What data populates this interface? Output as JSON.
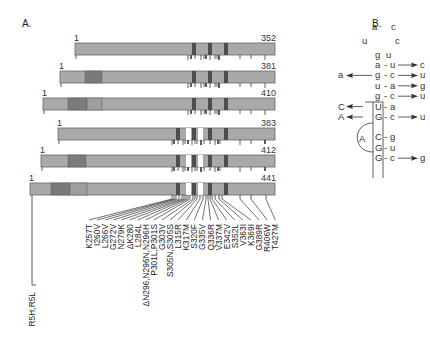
{
  "panels": {
    "a_label": "A.",
    "b_label": "B."
  },
  "colors": {
    "bar_fill": "#a9a9a9",
    "bar_stroke": "#666666",
    "n_domain_dark": "#7a7a7a",
    "n_domain_light": "#9e9e9e",
    "repeat_dark": "#4d4d4d",
    "insert_white": "#ffffff",
    "line": "#333333"
  },
  "isoforms": [
    {
      "start_label": "1",
      "end_label": "352",
      "x0": 75,
      "y": 43,
      "n_domains": [],
      "inserts": false,
      "label_x": 75
    },
    {
      "start_label": "1",
      "end_label": "381",
      "x0": 60,
      "y": 71,
      "n_domains": [
        [
          85,
          102,
          "dark"
        ]
      ],
      "inserts": false,
      "label_x": 60
    },
    {
      "start_label": "1",
      "end_label": "410",
      "x0": 43,
      "y": 98,
      "n_domains": [
        [
          68,
          87,
          "dark"
        ],
        [
          87,
          102,
          "light"
        ]
      ],
      "inserts": false,
      "label_x": 43
    },
    {
      "start_label": "1",
      "end_label": "383",
      "x0": 58,
      "y": 128,
      "n_domains": [],
      "inserts": true,
      "label_x": 58
    },
    {
      "start_label": "1",
      "end_label": "412",
      "x0": 41,
      "y": 155,
      "n_domains": [
        [
          68,
          86,
          "dark"
        ]
      ],
      "inserts": true,
      "label_x": 41
    },
    {
      "start_label": "1",
      "end_label": "441",
      "x0": 30,
      "y": 183,
      "n_domains": [
        [
          51,
          70,
          "dark"
        ],
        [
          70,
          87,
          "light"
        ]
      ],
      "inserts": true,
      "label_x": 30
    }
  ],
  "bar_end_x": 275,
  "bar_height": 12,
  "mutations": {
    "n_terminal": "R5H,R5L",
    "list": [
      "K257T",
      "I260V",
      "L266V",
      "G272V",
      "N279K",
      "ΔK280",
      "L284L",
      "ΔN296,N296N,N296H",
      "P301L,P301S",
      "G303V",
      "S305N,S305S",
      "L315R",
      "K317M",
      "S320F",
      "G335V",
      "Q336R",
      "V337M",
      "E342V",
      "S352L",
      "V363I",
      "K369I",
      "G389R",
      "R406W",
      "T427M"
    ]
  },
  "stem_loop": {
    "loop_top": [
      "a",
      "c"
    ],
    "loop_sides": [
      "u",
      "c"
    ],
    "loop_bottom": [
      "g",
      "u"
    ],
    "pairs": [
      {
        "left": "a",
        "right": "u",
        "mut_right": "c",
        "mut_left": ""
      },
      {
        "left": "g",
        "right": "c",
        "mut_right": "u",
        "mut_left": "a"
      },
      {
        "left": "u",
        "right": "a",
        "mut_right": "g",
        "mut_left": ""
      },
      {
        "left": "g",
        "right": "c",
        "mut_right": "u",
        "mut_left": ""
      },
      {
        "left": "U",
        "right": "a",
        "mut_right": "",
        "mut_left": "C"
      },
      {
        "left": "G",
        "right": "c",
        "mut_right": "u",
        "mut_left": "A"
      },
      {
        "left": "C",
        "right": "g",
        "mut_right": "",
        "mut_left": ""
      },
      {
        "left": "G",
        "right": "u",
        "mut_right": "",
        "mut_left": ""
      },
      {
        "left": "G",
        "right": "c",
        "mut_right": "g",
        "mut_left": ""
      }
    ],
    "bulge": "A",
    "dash": "-"
  }
}
